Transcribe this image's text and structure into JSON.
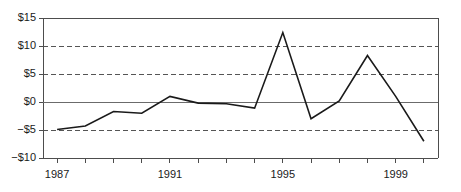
{
  "chart_data": {
    "type": "line",
    "title": "",
    "subtitle": "",
    "xlabel": "",
    "ylabel": "",
    "x": [
      1987,
      1988,
      1989,
      1990,
      1991,
      1992,
      1993,
      1994,
      1995,
      1996,
      1997,
      1998,
      1999,
      2000
    ],
    "values": [
      -4.9,
      -4.3,
      -1.7,
      -2.0,
      1.0,
      -0.2,
      -0.3,
      -1.1,
      12.4,
      -3.0,
      0.2,
      8.3,
      1.0,
      -7.0
    ],
    "series": [
      {
        "name": "",
        "values": [
          -4.9,
          -4.3,
          -1.7,
          -2.0,
          1.0,
          -0.2,
          -0.3,
          -1.1,
          12.4,
          -3.0,
          0.2,
          8.3,
          1.0,
          -7.0
        ]
      }
    ],
    "xlim": [
      1986.5,
      2000.5
    ],
    "ylim": [
      -10,
      15
    ],
    "yticks": [
      -10,
      -5,
      0,
      5,
      10,
      15
    ],
    "ytick_labels": [
      "−$10",
      "−$5",
      "$0",
      "$5",
      "$10",
      "$15"
    ],
    "xtick_values": [
      1987,
      1988,
      1989,
      1990,
      1991,
      1992,
      1993,
      1994,
      1995,
      1996,
      1997,
      1998,
      1999,
      2000
    ],
    "xtick_labels": [
      "1987",
      "",
      "",
      "",
      "1991",
      "",
      "",
      "",
      "1995",
      "",
      "",
      "",
      "1999",
      ""
    ],
    "xtick_labels_shown": [
      "1987",
      "1991",
      "1995",
      "1999"
    ],
    "grid": "horizontal-dashed",
    "gridlines_dashed": [
      -5,
      5,
      10
    ],
    "zero_line": 0,
    "legend": "none",
    "legend_position": "none",
    "line_color": "#1a1a1a",
    "grid_color": "#555555",
    "axis_color": "#4d4d4d",
    "background_color": "#ffffff"
  },
  "axes": {
    "y_tick_labels": [
      {
        "text": "$15",
        "value": 15
      },
      {
        "text": "$10",
        "value": 10
      },
      {
        "text": "$5",
        "value": 5
      },
      {
        "text": "$0",
        "value": 0
      },
      {
        "text": "−$5",
        "value": -5
      },
      {
        "text": "−$10",
        "value": -10
      }
    ],
    "x_tick_labels": [
      {
        "text": "1987",
        "value": 1987
      },
      {
        "text": "1991",
        "value": 1991
      },
      {
        "text": "1995",
        "value": 1995
      },
      {
        "text": "1999",
        "value": 1999
      }
    ]
  }
}
